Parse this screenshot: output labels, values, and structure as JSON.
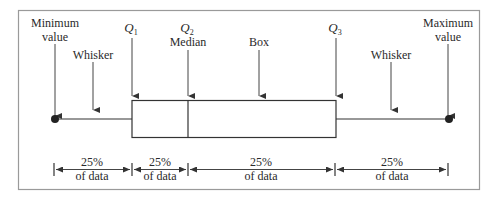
{
  "diagram": {
    "type": "box-and-whisker anatomy",
    "colors": {
      "ink": "#333333",
      "frame": "#9a9a9a",
      "background": "#ffffff"
    },
    "top_labels": {
      "minimum": [
        "Minimum",
        "value"
      ],
      "whisker_left": "Whisker",
      "q1": {
        "letter": "Q",
        "sub": "1"
      },
      "q2": {
        "letter": "Q",
        "sub": "2",
        "caption": "Median"
      },
      "box": "Box",
      "q3": {
        "letter": "Q",
        "sub": "3"
      },
      "whisker_right": "Whisker",
      "maximum": [
        "Maximum",
        "value"
      ]
    },
    "segments": [
      {
        "percent": "25%",
        "caption": "of data"
      },
      {
        "percent": "25%",
        "caption": "of data"
      },
      {
        "percent": "25%",
        "caption": "of data"
      },
      {
        "percent": "25%",
        "caption": "of data"
      }
    ]
  }
}
